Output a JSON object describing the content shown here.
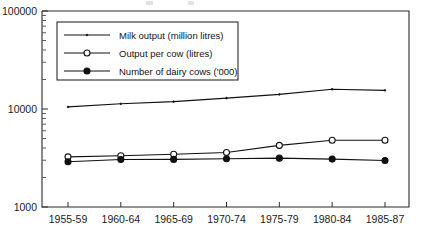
{
  "chart_data": {
    "type": "line",
    "title": "",
    "xlabel": "",
    "ylabel": "",
    "yscale": "log",
    "ylim": [
      1000,
      100000
    ],
    "grid": false,
    "legend_position": "upper-left",
    "categories": [
      "1955-59",
      "1960-64",
      "1965-69",
      "1970-74",
      "1975-79",
      "1980-84",
      "1985-87"
    ],
    "ytick_labels": [
      "1000",
      "10000",
      "100000"
    ],
    "ytick_values": [
      1000,
      10000,
      100000
    ],
    "series": [
      {
        "name": "Milk output (million litres)",
        "marker": "tiny-dot",
        "values": [
          10500,
          11300,
          11900,
          12900,
          14100,
          15900,
          15500
        ]
      },
      {
        "name": "Output per cow (litres)",
        "marker": "open-circle",
        "values": [
          3250,
          3330,
          3450,
          3600,
          4250,
          4800,
          4800
        ]
      },
      {
        "name": "Number of dairy cows ('000)",
        "marker": "filled-circle",
        "values": [
          2900,
          3050,
          3060,
          3110,
          3150,
          3080,
          2980
        ]
      }
    ]
  },
  "legend": {
    "entries": [
      {
        "label": "Milk output (million litres)"
      },
      {
        "label": "Output per cow (litres)"
      },
      {
        "label": "Number of dairy cows ('000)"
      }
    ]
  },
  "colors": {
    "line": "#111111",
    "frame": "#2b2b2b",
    "background": "#ffffff",
    "text": "#1a1a1a"
  }
}
